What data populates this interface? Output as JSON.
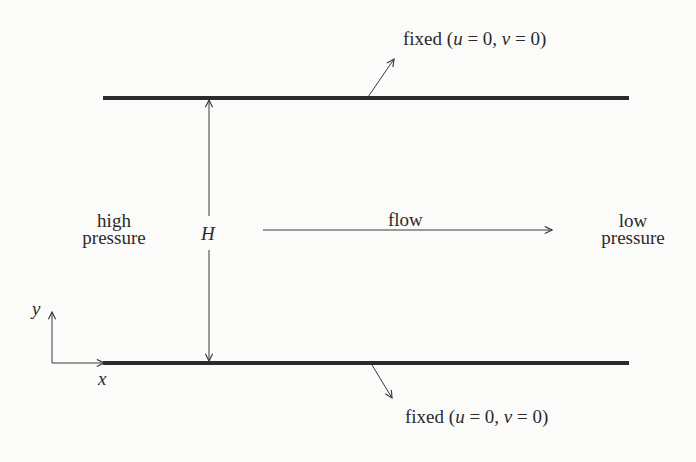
{
  "diagram": {
    "top_plate": {
      "label": "fixed (",
      "u": "u",
      "eq1": " = 0, ",
      "v": "v",
      "eq2": " = 0)"
    },
    "bottom_plate": {
      "label": "fixed (",
      "u": "u",
      "eq1": " = 0, ",
      "v": "v",
      "eq2": " = 0)"
    },
    "left_label": {
      "line1": "high",
      "line2": "pressure"
    },
    "right_label": {
      "line1": "low",
      "line2": "pressure"
    },
    "height_label": "H",
    "flow_label": "flow",
    "axes": {
      "x": "x",
      "y": "y"
    },
    "colors": {
      "plate": "#2b2b2b",
      "line": "#3a3a3a",
      "background": "#fbfbfa"
    }
  }
}
